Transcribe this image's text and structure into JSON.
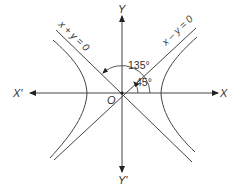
{
  "diagram": {
    "type": "rectangular-hyperbola",
    "colors": {
      "line": "#444444",
      "text": "#333333",
      "background": "#ffffff"
    },
    "axes": {
      "x_positive_label": "X",
      "x_negative_label": "X'",
      "y_positive_label": "Y",
      "y_negative_label": "Y'",
      "origin_label": "O"
    },
    "asymptotes": [
      {
        "label": "x + y = 0"
      },
      {
        "label": "x – y = 0"
      }
    ],
    "angles": [
      {
        "label": "135°"
      },
      {
        "label": "45°"
      }
    ],
    "branches": [
      "left-branch",
      "right-branch"
    ]
  }
}
